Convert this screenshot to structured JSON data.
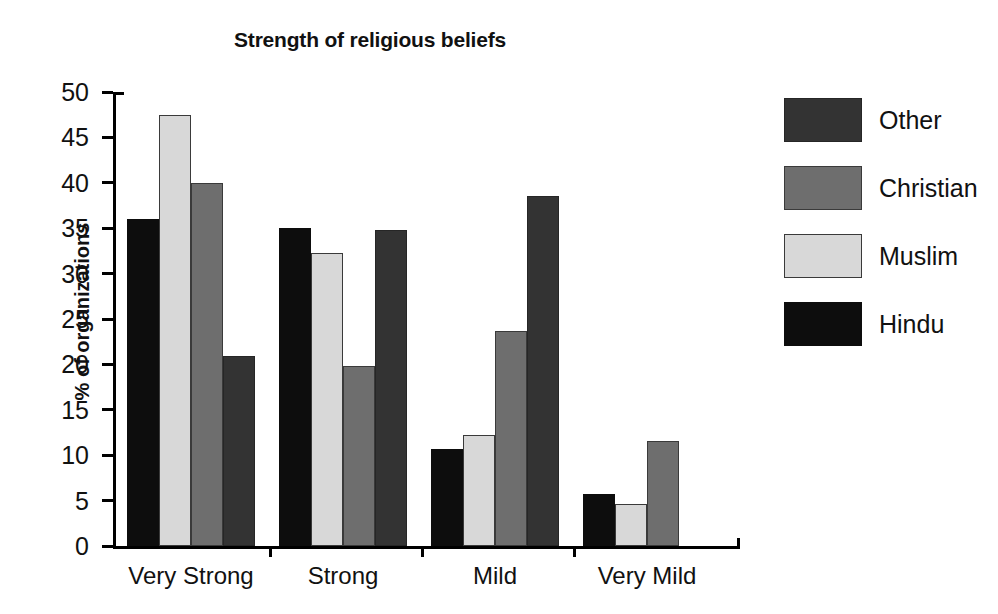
{
  "chart_data": {
    "type": "bar",
    "title": "Strength of religious beliefs",
    "xlabel": "",
    "ylabel": "% of organizations",
    "categories": [
      "Very Strong",
      "Strong",
      "Mild",
      "Very Mild"
    ],
    "ylim": [
      0,
      50
    ],
    "yticks": [
      0,
      5,
      10,
      15,
      20,
      25,
      30,
      35,
      40,
      45,
      50
    ],
    "ytick_labels": [
      "0",
      "5",
      "10",
      "15",
      "20",
      "25",
      "30",
      "35",
      "40",
      "45",
      "50"
    ],
    "grid": false,
    "legend_position": "right",
    "bar_order_in_group": [
      "Hindu",
      "Muslim",
      "Christian",
      "Other"
    ],
    "series": [
      {
        "name": "Other",
        "color": "#333333",
        "values": [
          20.9,
          34.8,
          38.6,
          0
        ]
      },
      {
        "name": "Christian",
        "color": "#6e6e6e",
        "values": [
          40.0,
          19.8,
          23.7,
          11.6
        ]
      },
      {
        "name": "Muslim",
        "color": "#d8d8d8",
        "values": [
          47.5,
          32.3,
          12.2,
          4.6
        ]
      },
      {
        "name": "Hindu",
        "color": "#0d0d0d",
        "values": [
          36.0,
          35.0,
          10.7,
          5.7
        ]
      }
    ]
  },
  "legend": {
    "items": [
      {
        "label": "Other",
        "color": "#333333"
      },
      {
        "label": "Christian",
        "color": "#6e6e6e"
      },
      {
        "label": "Muslim",
        "color": "#d8d8d8"
      },
      {
        "label": "Hindu",
        "color": "#0d0d0d"
      }
    ]
  }
}
